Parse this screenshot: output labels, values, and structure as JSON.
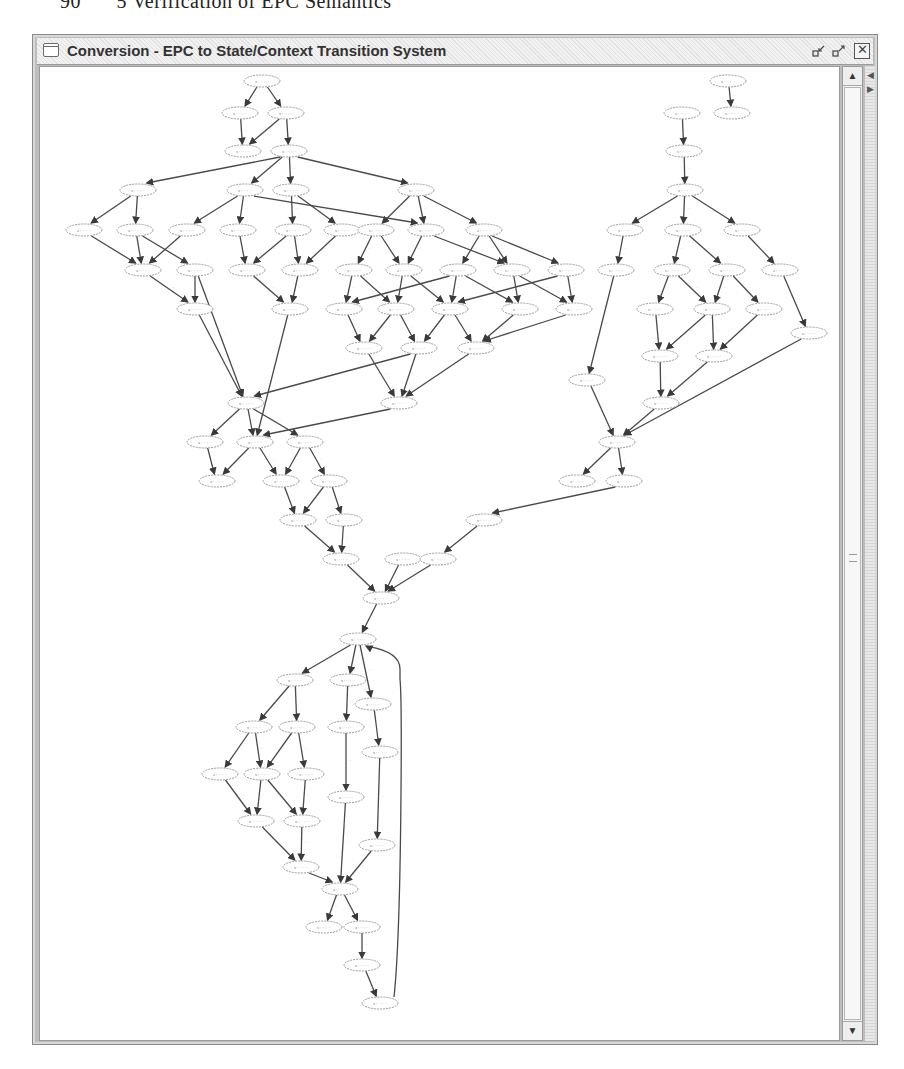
{
  "page_header": {
    "text": "5 Verification of EPC Semantics",
    "page_number": "90"
  },
  "window": {
    "title": "Conversion - EPC to State/Context Transition System",
    "icon": "window-icon",
    "buttons": {
      "minimize": "minimize-icon",
      "maximize": "maximize-icon",
      "close": "close-icon"
    },
    "close_glyph": "✕",
    "minimize_glyph": "⤡",
    "maximize_glyph": "⤢"
  },
  "scrollbar": {
    "up_glyph": "▲",
    "down_glyph": "▼",
    "position": "top"
  },
  "side_strip": {
    "left_glyph": "◀",
    "right_glyph": "▶"
  },
  "graph": {
    "type": "state-context transition system",
    "node_label_note": "node and edge labels illegible at screenshot resolution",
    "node_label": "s : ·· : ··",
    "edge_label": "··",
    "nodes": [
      {
        "id": "n1",
        "x": 222,
        "y": 14
      },
      {
        "id": "n2",
        "x": 200,
        "y": 46
      },
      {
        "id": "n3",
        "x": 246,
        "y": 46
      },
      {
        "id": "n4",
        "x": 203,
        "y": 84
      },
      {
        "id": "n5",
        "x": 249,
        "y": 84
      },
      {
        "id": "n6",
        "x": 98,
        "y": 123
      },
      {
        "id": "n7",
        "x": 205,
        "y": 123
      },
      {
        "id": "n8",
        "x": 251,
        "y": 123
      },
      {
        "id": "n9",
        "x": 376,
        "y": 123
      },
      {
        "id": "n10",
        "x": 44,
        "y": 163
      },
      {
        "id": "n11",
        "x": 95,
        "y": 163
      },
      {
        "id": "n12",
        "x": 147,
        "y": 163
      },
      {
        "id": "n13",
        "x": 198,
        "y": 163
      },
      {
        "id": "n14",
        "x": 253,
        "y": 163
      },
      {
        "id": "n15",
        "x": 302,
        "y": 163
      },
      {
        "id": "n16",
        "x": 336,
        "y": 163
      },
      {
        "id": "n17",
        "x": 386,
        "y": 163
      },
      {
        "id": "n18",
        "x": 444,
        "y": 163
      },
      {
        "id": "n19",
        "x": 103,
        "y": 203
      },
      {
        "id": "n20",
        "x": 155,
        "y": 203
      },
      {
        "id": "n21",
        "x": 207,
        "y": 203
      },
      {
        "id": "n22",
        "x": 260,
        "y": 203
      },
      {
        "id": "n23",
        "x": 314,
        "y": 203
      },
      {
        "id": "n24",
        "x": 364,
        "y": 203
      },
      {
        "id": "n25",
        "x": 418,
        "y": 203
      },
      {
        "id": "n26",
        "x": 472,
        "y": 203
      },
      {
        "id": "n27",
        "x": 526,
        "y": 203
      },
      {
        "id": "n28",
        "x": 155,
        "y": 242
      },
      {
        "id": "n29",
        "x": 250,
        "y": 242
      },
      {
        "id": "n30",
        "x": 304,
        "y": 242
      },
      {
        "id": "n31",
        "x": 356,
        "y": 242
      },
      {
        "id": "n32",
        "x": 410,
        "y": 242
      },
      {
        "id": "n33",
        "x": 480,
        "y": 242
      },
      {
        "id": "n34",
        "x": 534,
        "y": 242
      },
      {
        "id": "n35",
        "x": 324,
        "y": 281
      },
      {
        "id": "n36",
        "x": 379,
        "y": 281
      },
      {
        "id": "n37",
        "x": 436,
        "y": 281
      },
      {
        "id": "n38",
        "x": 206,
        "y": 336
      },
      {
        "id": "n39",
        "x": 359,
        "y": 336
      },
      {
        "id": "n40",
        "x": 165,
        "y": 375
      },
      {
        "id": "n41",
        "x": 215,
        "y": 375
      },
      {
        "id": "n42",
        "x": 265,
        "y": 375
      },
      {
        "id": "n43",
        "x": 177,
        "y": 414
      },
      {
        "id": "n44",
        "x": 241,
        "y": 414
      },
      {
        "id": "n45",
        "x": 289,
        "y": 414
      },
      {
        "id": "n46",
        "x": 258,
        "y": 453
      },
      {
        "id": "n47",
        "x": 304,
        "y": 453
      },
      {
        "id": "n48",
        "x": 301,
        "y": 492
      },
      {
        "id": "n49",
        "x": 363,
        "y": 492
      },
      {
        "id": "n50",
        "x": 341,
        "y": 531
      },
      {
        "id": "n51",
        "x": 318,
        "y": 572
      },
      {
        "id": "n52",
        "x": 255,
        "y": 613
      },
      {
        "id": "n53",
        "x": 308,
        "y": 613
      },
      {
        "id": "n54",
        "x": 333,
        "y": 637
      },
      {
        "id": "n55",
        "x": 214,
        "y": 660
      },
      {
        "id": "n56",
        "x": 257,
        "y": 660
      },
      {
        "id": "n57",
        "x": 306,
        "y": 660
      },
      {
        "id": "n58",
        "x": 340,
        "y": 685
      },
      {
        "id": "n59",
        "x": 180,
        "y": 707
      },
      {
        "id": "n60",
        "x": 222,
        "y": 707
      },
      {
        "id": "n61",
        "x": 266,
        "y": 707
      },
      {
        "id": "n62",
        "x": 306,
        "y": 730
      },
      {
        "id": "n63",
        "x": 216,
        "y": 754
      },
      {
        "id": "n64",
        "x": 262,
        "y": 754
      },
      {
        "id": "n65",
        "x": 337,
        "y": 778
      },
      {
        "id": "n66",
        "x": 261,
        "y": 800
      },
      {
        "id": "n67",
        "x": 300,
        "y": 822
      },
      {
        "id": "n68",
        "x": 284,
        "y": 860
      },
      {
        "id": "n69",
        "x": 322,
        "y": 860
      },
      {
        "id": "n70",
        "x": 322,
        "y": 898
      },
      {
        "id": "n71",
        "x": 340,
        "y": 936
      },
      {
        "id": "n72",
        "x": 688,
        "y": 14
      },
      {
        "id": "n73",
        "x": 692,
        "y": 46
      },
      {
        "id": "n74",
        "x": 642,
        "y": 46
      },
      {
        "id": "n75",
        "x": 644,
        "y": 84
      },
      {
        "id": "n76",
        "x": 645,
        "y": 123
      },
      {
        "id": "n77",
        "x": 585,
        "y": 163
      },
      {
        "id": "n78",
        "x": 643,
        "y": 163
      },
      {
        "id": "n79",
        "x": 702,
        "y": 163
      },
      {
        "id": "n80",
        "x": 576,
        "y": 203
      },
      {
        "id": "n81",
        "x": 632,
        "y": 203
      },
      {
        "id": "n82",
        "x": 687,
        "y": 203
      },
      {
        "id": "n83",
        "x": 740,
        "y": 203
      },
      {
        "id": "n84",
        "x": 615,
        "y": 242
      },
      {
        "id": "n85",
        "x": 672,
        "y": 242
      },
      {
        "id": "n86",
        "x": 724,
        "y": 242
      },
      {
        "id": "n87",
        "x": 769,
        "y": 266
      },
      {
        "id": "n88",
        "x": 620,
        "y": 289
      },
      {
        "id": "n89",
        "x": 674,
        "y": 289
      },
      {
        "id": "n90",
        "x": 547,
        "y": 313
      },
      {
        "id": "n91",
        "x": 621,
        "y": 336
      },
      {
        "id": "n92",
        "x": 577,
        "y": 375
      },
      {
        "id": "n93",
        "x": 537,
        "y": 414
      },
      {
        "id": "n94",
        "x": 584,
        "y": 414
      },
      {
        "id": "n95",
        "x": 444,
        "y": 453
      },
      {
        "id": "n96",
        "x": 398,
        "y": 492
      }
    ],
    "edges": [
      [
        "n1",
        "n2"
      ],
      [
        "n1",
        "n3"
      ],
      [
        "n2",
        "n4"
      ],
      [
        "n3",
        "n4"
      ],
      [
        "n3",
        "n5"
      ],
      [
        "n5",
        "n6"
      ],
      [
        "n5",
        "n7"
      ],
      [
        "n5",
        "n8"
      ],
      [
        "n5",
        "n9"
      ],
      [
        "n6",
        "n10"
      ],
      [
        "n6",
        "n11"
      ],
      [
        "n7",
        "n12"
      ],
      [
        "n7",
        "n13"
      ],
      [
        "n8",
        "n14"
      ],
      [
        "n8",
        "n15"
      ],
      [
        "n7",
        "n17"
      ],
      [
        "n9",
        "n16"
      ],
      [
        "n9",
        "n17"
      ],
      [
        "n9",
        "n18"
      ],
      [
        "n10",
        "n19"
      ],
      [
        "n11",
        "n19"
      ],
      [
        "n11",
        "n20"
      ],
      [
        "n12",
        "n19"
      ],
      [
        "n13",
        "n21"
      ],
      [
        "n14",
        "n21"
      ],
      [
        "n14",
        "n22"
      ],
      [
        "n15",
        "n22"
      ],
      [
        "n16",
        "n23"
      ],
      [
        "n16",
        "n24"
      ],
      [
        "n17",
        "n24"
      ],
      [
        "n17",
        "n26"
      ],
      [
        "n18",
        "n25"
      ],
      [
        "n18",
        "n26"
      ],
      [
        "n18",
        "n27"
      ],
      [
        "n19",
        "n28"
      ],
      [
        "n20",
        "n28"
      ],
      [
        "n22",
        "n29"
      ],
      [
        "n21",
        "n29"
      ],
      [
        "n23",
        "n30"
      ],
      [
        "n23",
        "n31"
      ],
      [
        "n24",
        "n31"
      ],
      [
        "n24",
        "n32"
      ],
      [
        "n25",
        "n30"
      ],
      [
        "n25",
        "n32"
      ],
      [
        "n25",
        "n33"
      ],
      [
        "n26",
        "n33"
      ],
      [
        "n26",
        "n34"
      ],
      [
        "n27",
        "n34"
      ],
      [
        "n27",
        "n32"
      ],
      [
        "n30",
        "n35"
      ],
      [
        "n31",
        "n36"
      ],
      [
        "n31",
        "n35"
      ],
      [
        "n32",
        "n36"
      ],
      [
        "n32",
        "n37"
      ],
      [
        "n33",
        "n37"
      ],
      [
        "n34",
        "n37"
      ],
      [
        "n35",
        "n39"
      ],
      [
        "n36",
        "n39"
      ],
      [
        "n37",
        "n39"
      ],
      [
        "n36",
        "n38"
      ],
      [
        "n28",
        "n38"
      ],
      [
        "n20",
        "n38"
      ],
      [
        "n29",
        "n41"
      ],
      [
        "n39",
        "n41"
      ],
      [
        "n38",
        "n40"
      ],
      [
        "n38",
        "n41"
      ],
      [
        "n38",
        "n42"
      ],
      [
        "n40",
        "n43"
      ],
      [
        "n41",
        "n43"
      ],
      [
        "n41",
        "n44"
      ],
      [
        "n42",
        "n44"
      ],
      [
        "n42",
        "n45"
      ],
      [
        "n44",
        "n46"
      ],
      [
        "n45",
        "n46"
      ],
      [
        "n45",
        "n47"
      ],
      [
        "n46",
        "n48"
      ],
      [
        "n47",
        "n48"
      ],
      [
        "n48",
        "n50"
      ],
      [
        "n49",
        "n50"
      ],
      [
        "n50",
        "n51"
      ],
      [
        "n51",
        "n52"
      ],
      [
        "n51",
        "n53"
      ],
      [
        "n51",
        "n54"
      ],
      [
        "n52",
        "n55"
      ],
      [
        "n52",
        "n56"
      ],
      [
        "n53",
        "n57"
      ],
      [
        "n54",
        "n58"
      ],
      [
        "n55",
        "n59"
      ],
      [
        "n55",
        "n60"
      ],
      [
        "n56",
        "n60"
      ],
      [
        "n56",
        "n61"
      ],
      [
        "n57",
        "n62"
      ],
      [
        "n58",
        "n65"
      ],
      [
        "n59",
        "n63"
      ],
      [
        "n60",
        "n63"
      ],
      [
        "n60",
        "n64"
      ],
      [
        "n61",
        "n64"
      ],
      [
        "n63",
        "n66"
      ],
      [
        "n64",
        "n66"
      ],
      [
        "n62",
        "n67"
      ],
      [
        "n66",
        "n67"
      ],
      [
        "n65",
        "n67"
      ],
      [
        "n67",
        "n68"
      ],
      [
        "n67",
        "n69"
      ],
      [
        "n69",
        "n70"
      ],
      [
        "n70",
        "n71"
      ],
      [
        "n71",
        "n51"
      ],
      [
        "n72",
        "n73"
      ],
      [
        "n74",
        "n75"
      ],
      [
        "n75",
        "n76"
      ],
      [
        "n76",
        "n77"
      ],
      [
        "n76",
        "n78"
      ],
      [
        "n76",
        "n79"
      ],
      [
        "n77",
        "n80"
      ],
      [
        "n78",
        "n81"
      ],
      [
        "n78",
        "n82"
      ],
      [
        "n79",
        "n83"
      ],
      [
        "n81",
        "n84"
      ],
      [
        "n81",
        "n85"
      ],
      [
        "n82",
        "n85"
      ],
      [
        "n82",
        "n86"
      ],
      [
        "n83",
        "n87"
      ],
      [
        "n84",
        "n88"
      ],
      [
        "n85",
        "n88"
      ],
      [
        "n85",
        "n89"
      ],
      [
        "n86",
        "n89"
      ],
      [
        "n80",
        "n90"
      ],
      [
        "n88",
        "n91"
      ],
      [
        "n89",
        "n91"
      ],
      [
        "n90",
        "n92"
      ],
      [
        "n91",
        "n92"
      ],
      [
        "n87",
        "n92"
      ],
      [
        "n92",
        "n93"
      ],
      [
        "n92",
        "n94"
      ],
      [
        "n94",
        "n95"
      ],
      [
        "n95",
        "n96"
      ],
      [
        "n96",
        "n50"
      ]
    ],
    "curved_edges": [
      {
        "from": "n19",
        "to": "n38"
      },
      {
        "from": "n71",
        "to": "n51",
        "note": "long return edge along right side"
      }
    ]
  }
}
